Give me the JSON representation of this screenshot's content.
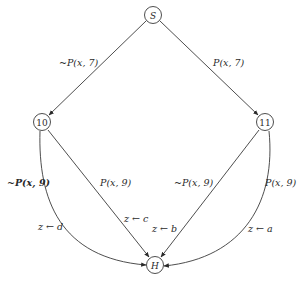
{
  "diagram": {
    "type": "flowgraph",
    "nodes": {
      "S": {
        "label": "S",
        "cx": 153,
        "cy": 15
      },
      "n10": {
        "label": "10",
        "cx": 42,
        "cy": 122
      },
      "n11": {
        "label": "11",
        "cx": 265,
        "cy": 122
      },
      "H": {
        "label": "H",
        "cx": 155,
        "cy": 265
      }
    },
    "edges": [
      {
        "from": "S",
        "to": "10",
        "label": "~P(x, 7)"
      },
      {
        "from": "S",
        "to": "11",
        "label": "P(x, 7)"
      },
      {
        "from": "10",
        "to": "H",
        "label": "~P(x, 9)",
        "style": "curved",
        "assignment": "z ← d"
      },
      {
        "from": "10",
        "to": "H",
        "label": "P(x, 9)",
        "style": "straight",
        "assignment": "z ← c"
      },
      {
        "from": "11",
        "to": "H",
        "label": "~P(x, 9)",
        "style": "straight",
        "assignment": "z ← b"
      },
      {
        "from": "11",
        "to": "H",
        "label": "P(x, 9)",
        "style": "curved",
        "assignment": "z ← a"
      }
    ],
    "labels": {
      "s_to_10": "~P(x, 7)",
      "s_to_11": "P(x, 7)",
      "e10_curved": "~P(x, 9)",
      "e10_straight": "P(x, 9)",
      "e11_straight": "~P(x, 9)",
      "e11_curved": "P(x, 9)",
      "assign_d": "z ← d",
      "assign_c": "z ← c",
      "assign_b": "z ← b",
      "assign_a": "z ← a"
    }
  }
}
